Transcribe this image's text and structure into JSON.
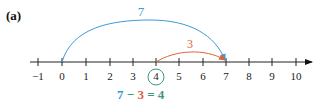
{
  "figure": {
    "label": "(a)",
    "number_line": {
      "ticks": [
        "−1",
        "0",
        "1",
        "2",
        "3",
        "4",
        "5",
        "6",
        "7",
        "8",
        "9",
        "10"
      ],
      "circled_value": "4"
    },
    "arcs": [
      {
        "from": 0,
        "to": 7,
        "label": "7",
        "color": "#3a9ad9"
      },
      {
        "from": 4,
        "to": 7,
        "label": "3",
        "color": "#e0643c"
      }
    ],
    "equation": {
      "a": "7",
      "minus": " − ",
      "b": "3",
      "equals": " = ",
      "result": "4"
    },
    "colors": {
      "blue": "#3a9ad9",
      "orange": "#e0643c",
      "green": "#3a9a7a"
    }
  }
}
